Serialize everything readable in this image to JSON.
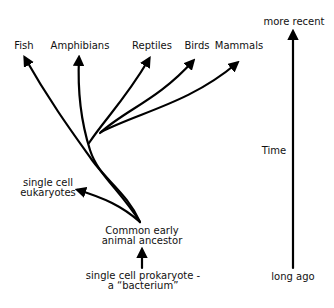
{
  "diagram": {
    "type": "evolutionary-tree",
    "colors": {
      "line": "#000000",
      "text": "#111111",
      "background": "#ffffff"
    },
    "taxa": [
      {
        "id": "fish",
        "label": "Fish"
      },
      {
        "id": "amphibians",
        "label": "Amphibians"
      },
      {
        "id": "reptiles",
        "label": "Reptiles"
      },
      {
        "id": "birds",
        "label": "Birds"
      },
      {
        "id": "mammals",
        "label": "Mammals"
      }
    ],
    "eukaryotes": {
      "line1": "single cell",
      "line2": "eukaryotes"
    },
    "ancestor": {
      "line1": "Common early",
      "line2": "animal ancestor"
    },
    "prokaryote": {
      "line1": "single cell prokaryote -",
      "line2": "a “bacterium”"
    },
    "time_axis": {
      "top_label": "more recent",
      "middle_label": "Time",
      "bottom_label": "long ago"
    }
  }
}
